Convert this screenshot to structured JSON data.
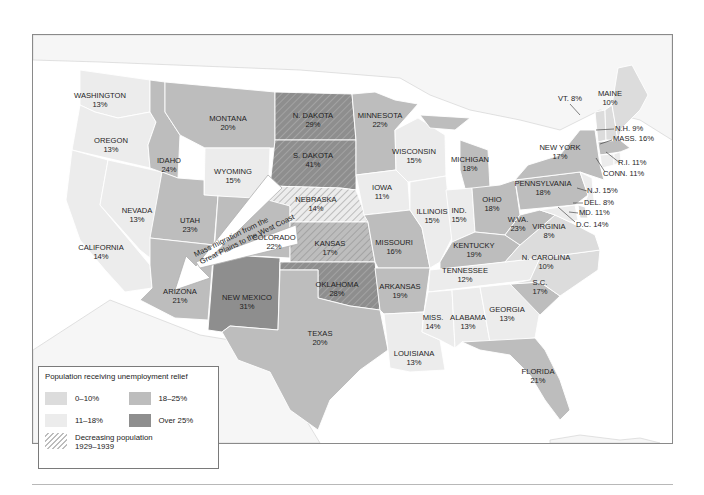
{
  "map": {
    "title": "Population receiving unemployment relief",
    "colors": {
      "band_0_10": "#dcdcdc",
      "band_11_18": "#ececec",
      "band_18_25": "#bdbdbd",
      "band_over_25": "#8e8e8e",
      "water": "#ffffff",
      "outside": "#f5f5f5",
      "border": "#ffffff",
      "frame": "#8a8a8a"
    },
    "arrow_label_line1": "Mass migration from the",
    "arrow_label_line2": "Great Plains to the West Coast",
    "states": [
      {
        "name": "WASHINGTON",
        "pct": "13%",
        "band": "11-18%",
        "decreasing": false
      },
      {
        "name": "OREGON",
        "pct": "13%",
        "band": "11-18%",
        "decreasing": false
      },
      {
        "name": "CALIFORNIA",
        "pct": "14%",
        "band": "11-18%",
        "decreasing": false
      },
      {
        "name": "NEVADA",
        "pct": "13%",
        "band": "11-18%",
        "decreasing": false
      },
      {
        "name": "IDAHO",
        "pct": "24%",
        "band": "18-25%",
        "decreasing": false
      },
      {
        "name": "MONTANA",
        "pct": "20%",
        "band": "18-25%",
        "decreasing": false
      },
      {
        "name": "WYOMING",
        "pct": "15%",
        "band": "11-18%",
        "decreasing": false
      },
      {
        "name": "UTAH",
        "pct": "23%",
        "band": "18-25%",
        "decreasing": false
      },
      {
        "name": "ARIZONA",
        "pct": "21%",
        "band": "18-25%",
        "decreasing": false
      },
      {
        "name": "COLORADO",
        "pct": "22%",
        "band": "18-25%",
        "decreasing": false
      },
      {
        "name": "NEW MEXICO",
        "pct": "31%",
        "band": "Over 25%",
        "decreasing": false
      },
      {
        "name": "N. DAKOTA",
        "pct": "29%",
        "band": "Over 25%",
        "decreasing": true
      },
      {
        "name": "S. DAKOTA",
        "pct": "41%",
        "band": "Over 25%",
        "decreasing": true
      },
      {
        "name": "NEBRASKA",
        "pct": "14%",
        "band": "11-18%",
        "decreasing": true
      },
      {
        "name": "KANSAS",
        "pct": "17%",
        "band": "18-25%",
        "decreasing": true
      },
      {
        "name": "OKLAHOMA",
        "pct": "28%",
        "band": "Over 25%",
        "decreasing": true
      },
      {
        "name": "TEXAS",
        "pct": "20%",
        "band": "18-25%",
        "decreasing": false
      },
      {
        "name": "MINNESOTA",
        "pct": "22%",
        "band": "18-25%",
        "decreasing": false
      },
      {
        "name": "IOWA",
        "pct": "11%",
        "band": "11-18%",
        "decreasing": false
      },
      {
        "name": "MISSOURI",
        "pct": "16%",
        "band": "18-25%",
        "decreasing": false
      },
      {
        "name": "ARKANSAS",
        "pct": "19%",
        "band": "18-25%",
        "decreasing": false
      },
      {
        "name": "LOUISIANA",
        "pct": "13%",
        "band": "11-18%",
        "decreasing": false
      },
      {
        "name": "WISCONSIN",
        "pct": "15%",
        "band": "11-18%",
        "decreasing": false
      },
      {
        "name": "ILLINOIS",
        "pct": "15%",
        "band": "11-18%",
        "decreasing": false
      },
      {
        "name": "MICHIGAN",
        "pct": "18%",
        "band": "18-25%",
        "decreasing": false
      },
      {
        "name": "IND.",
        "pct": "15%",
        "band": "11-18%",
        "decreasing": false
      },
      {
        "name": "OHIO",
        "pct": "18%",
        "band": "18-25%",
        "decreasing": false
      },
      {
        "name": "KENTUCKY",
        "pct": "19%",
        "band": "18-25%",
        "decreasing": false
      },
      {
        "name": "TENNESSEE",
        "pct": "12%",
        "band": "11-18%",
        "decreasing": false
      },
      {
        "name": "MISS.",
        "pct": "14%",
        "band": "11-18%",
        "decreasing": false
      },
      {
        "name": "ALABAMA",
        "pct": "13%",
        "band": "11-18%",
        "decreasing": false
      },
      {
        "name": "GEORGIA",
        "pct": "13%",
        "band": "11-18%",
        "decreasing": false
      },
      {
        "name": "FLORIDA",
        "pct": "21%",
        "band": "18-25%",
        "decreasing": false
      },
      {
        "name": "S.C.",
        "pct": "17%",
        "band": "18-25%",
        "decreasing": false
      },
      {
        "name": "N. CAROLINA",
        "pct": "10%",
        "band": "0-10%",
        "decreasing": false
      },
      {
        "name": "VIRGINIA",
        "pct": "8%",
        "band": "0-10%",
        "decreasing": false
      },
      {
        "name": "W.VA.",
        "pct": "23%",
        "band": "18-25%",
        "decreasing": false
      },
      {
        "name": "PENNSYLVANIA",
        "pct": "18%",
        "band": "18-25%",
        "decreasing": false
      },
      {
        "name": "NEW YORK",
        "pct": "17%",
        "band": "18-25%",
        "decreasing": false
      },
      {
        "name": "MAINE",
        "pct": "10%",
        "band": "0-10%",
        "decreasing": false
      },
      {
        "name": "VT.",
        "pct": "8%",
        "band": "0-10%",
        "decreasing": false
      },
      {
        "name": "N.H.",
        "pct": "9%",
        "band": "0-10%",
        "decreasing": false
      },
      {
        "name": "MASS.",
        "pct": "16%",
        "band": "18-25%",
        "decreasing": false
      },
      {
        "name": "R.I.",
        "pct": "11%",
        "band": "11-18%",
        "decreasing": false
      },
      {
        "name": "CONN.",
        "pct": "11%",
        "band": "11-18%",
        "decreasing": false
      },
      {
        "name": "N.J.",
        "pct": "15%",
        "band": "11-18%",
        "decreasing": false
      },
      {
        "name": "DEL.",
        "pct": "8%",
        "band": "0-10%",
        "decreasing": false
      },
      {
        "name": "MD.",
        "pct": "11%",
        "band": "11-18%",
        "decreasing": false
      },
      {
        "name": "D.C.",
        "pct": "14%",
        "band": "11-18%",
        "decreasing": false
      }
    ]
  },
  "legend": {
    "title": "Population receiving unemployment relief",
    "items": [
      {
        "label": "0–10%",
        "color": "#dcdcdc"
      },
      {
        "label": "18–25%",
        "color": "#bdbdbd"
      },
      {
        "label": "11–18%",
        "color": "#ececec"
      },
      {
        "label": "Over 25%",
        "color": "#8e8e8e"
      }
    ],
    "hatch_label_line1": "Decreasing population",
    "hatch_label_line2": "1929–1939"
  },
  "labels": {
    "wa": {
      "n": "WASHINGTON",
      "p": "13%"
    },
    "or": {
      "n": "OREGON",
      "p": "13%"
    },
    "ca": {
      "n": "CALIFORNIA",
      "p": "14%"
    },
    "nv": {
      "n": "NEVADA",
      "p": "13%"
    },
    "id": {
      "n": "IDAHO",
      "p": "24%"
    },
    "mt": {
      "n": "MONTANA",
      "p": "20%"
    },
    "wy": {
      "n": "WYOMING",
      "p": "15%"
    },
    "ut": {
      "n": "UTAH",
      "p": "23%"
    },
    "az": {
      "n": "ARIZONA",
      "p": "21%"
    },
    "co": {
      "n": "COLORADO",
      "p": "22%"
    },
    "nm": {
      "n": "NEW MEXICO",
      "p": "31%"
    },
    "nd": {
      "n": "N. DAKOTA",
      "p": "29%"
    },
    "sd": {
      "n": "S. DAKOTA",
      "p": "41%"
    },
    "ne": {
      "n": "NEBRASKA",
      "p": "14%"
    },
    "ks": {
      "n": "KANSAS",
      "p": "17%"
    },
    "ok": {
      "n": "OKLAHOMA",
      "p": "28%"
    },
    "tx": {
      "n": "TEXAS",
      "p": "20%"
    },
    "mn": {
      "n": "MINNESOTA",
      "p": "22%"
    },
    "ia": {
      "n": "IOWA",
      "p": "11%"
    },
    "mo": {
      "n": "MISSOURI",
      "p": "16%"
    },
    "ar": {
      "n": "ARKANSAS",
      "p": "19%"
    },
    "la": {
      "n": "LOUISIANA",
      "p": "13%"
    },
    "wi": {
      "n": "WISCONSIN",
      "p": "15%"
    },
    "il": {
      "n": "ILLINOIS",
      "p": "15%"
    },
    "mi": {
      "n": "MICHIGAN",
      "p": "18%"
    },
    "in": {
      "n": "IND.",
      "p": "15%"
    },
    "oh": {
      "n": "OHIO",
      "p": "18%"
    },
    "ky": {
      "n": "KENTUCKY",
      "p": "19%"
    },
    "tn": {
      "n": "TENNESSEE",
      "p": "12%"
    },
    "ms": {
      "n": "MISS.",
      "p": "14%"
    },
    "al": {
      "n": "ALABAMA",
      "p": "13%"
    },
    "ga": {
      "n": "GEORGIA",
      "p": "13%"
    },
    "fl": {
      "n": "FLORIDA",
      "p": "21%"
    },
    "sc": {
      "n": "S.C.",
      "p": "17%"
    },
    "nc": {
      "n": "N. CAROLINA",
      "p": "10%"
    },
    "va": {
      "n": "VIRGINIA",
      "p": "8%"
    },
    "wv": {
      "n": "W.VA.",
      "p": "23%"
    },
    "pa": {
      "n": "PENNSYLVANIA",
      "p": "18%"
    },
    "ny": {
      "n": "NEW YORK",
      "p": "17%"
    },
    "me": {
      "n": "MAINE",
      "p": "10%"
    },
    "vt": "VT. 8%",
    "nh": "N.H. 9%",
    "ma": "MASS. 16%",
    "ri": "R.I. 11%",
    "ct": "CONN. 11%",
    "nj": "N.J. 15%",
    "de": "DEL. 8%",
    "md": "MD. 11%",
    "dc": "D.C. 14%"
  }
}
